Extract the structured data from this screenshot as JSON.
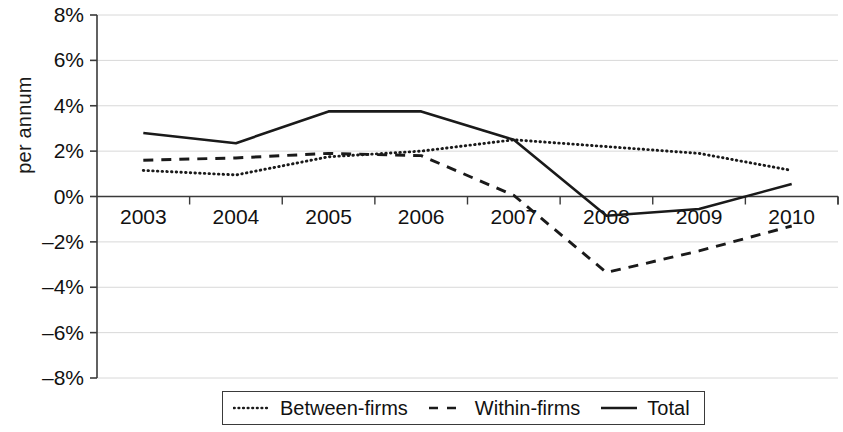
{
  "axes": {
    "ylabel": "per annum",
    "yticks": [
      "8%",
      "6%",
      "4%",
      "2%",
      "0%",
      "–2%",
      "–4%",
      "–6%",
      "–8%"
    ],
    "xticks": [
      "2003",
      "2004",
      "2005",
      "2006",
      "2007",
      "2008",
      "2009",
      "2010"
    ]
  },
  "legend": {
    "items": [
      {
        "label": "Between-firms",
        "style": "dotted"
      },
      {
        "label": "Within-firms",
        "style": "dashed"
      },
      {
        "label": "Total",
        "style": "solid"
      }
    ]
  },
  "colors": {
    "line": "#1a1a1a",
    "grid": "#d8d8d8",
    "axis": "#3a3a3a"
  },
  "chart_data": {
    "type": "line",
    "title": "",
    "xlabel": "",
    "ylabel": "per annum",
    "categories": [
      "2003",
      "2004",
      "2005",
      "2006",
      "2007",
      "2008",
      "2009",
      "2010"
    ],
    "ylim": [
      -8,
      8
    ],
    "ytick_values": [
      8,
      6,
      4,
      2,
      0,
      -2,
      -4,
      -6,
      -8
    ],
    "grid": true,
    "legend_position": "bottom",
    "units": "percent per annum",
    "series": [
      {
        "name": "Between-firms",
        "style": "dotted",
        "values": [
          1.15,
          0.95,
          1.75,
          2.0,
          2.5,
          2.2,
          1.9,
          1.15
        ]
      },
      {
        "name": "Within-firms",
        "style": "dashed",
        "values": [
          1.6,
          1.7,
          1.9,
          1.8,
          0.05,
          -3.35,
          -2.4,
          -1.3
        ]
      },
      {
        "name": "Total",
        "style": "solid",
        "values": [
          2.8,
          2.35,
          3.75,
          3.75,
          2.5,
          -0.85,
          -0.55,
          0.55
        ]
      }
    ]
  }
}
